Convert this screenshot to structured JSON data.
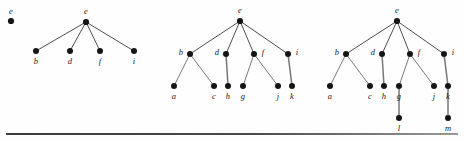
{
  "figure": {
    "caption_rule": "horizontal-rule",
    "panels": [
      {
        "id": "panel-0",
        "name": "single-node-graph",
        "nodes": [
          {
            "id": "n0-e",
            "label": "e",
            "x": 11,
            "y": 21,
            "label_x": 11,
            "label_y": 11,
            "r": 3.1
          }
        ],
        "edges": []
      },
      {
        "id": "panel-1",
        "name": "depth-two-tree",
        "nodes": [
          {
            "id": "n1-e",
            "label": "e",
            "x": 86,
            "y": 22,
            "label_x": 86,
            "label_y": 11,
            "r": 3.1
          },
          {
            "id": "n1-b",
            "label": "b",
            "x": 36,
            "y": 51,
            "label_x": 36,
            "label_y": 61,
            "r": 3.0
          },
          {
            "id": "n1-d",
            "label": "d",
            "x": 70,
            "y": 51,
            "label_x": 70,
            "label_y": 61,
            "r": 3.0
          },
          {
            "id": "n1-f",
            "label": "f",
            "x": 100,
            "y": 51,
            "label_x": 100,
            "label_y": 61,
            "r": 3.0
          },
          {
            "id": "n1-i",
            "label": "i",
            "x": 134,
            "y": 51,
            "label_x": 134,
            "label_y": 61,
            "r": 3.0
          }
        ],
        "edges": [
          {
            "from": "n1-e",
            "to": "n1-b",
            "kind": "root"
          },
          {
            "from": "n1-e",
            "to": "n1-d",
            "kind": "root"
          },
          {
            "from": "n1-e",
            "to": "n1-f",
            "kind": "root"
          },
          {
            "from": "n1-e",
            "to": "n1-i",
            "kind": "root"
          }
        ]
      },
      {
        "id": "panel-2",
        "name": "depth-three-tree",
        "nodes": [
          {
            "id": "n2-e",
            "label": "e",
            "x": 240,
            "y": 21,
            "label_x": 240,
            "label_y": 10,
            "r": 3.1
          },
          {
            "id": "n2-b",
            "label": "b",
            "x": 190,
            "y": 54,
            "label_x": 181,
            "label_y": 52,
            "r": 3.0
          },
          {
            "id": "n2-d",
            "label": "d",
            "x": 226,
            "y": 54,
            "label_x": 217,
            "label_y": 52,
            "r": 3.0
          },
          {
            "id": "n2-f",
            "label": "f",
            "x": 254,
            "y": 54,
            "label_x": 263,
            "label_y": 52,
            "r": 3.0
          },
          {
            "id": "n2-i",
            "label": "i",
            "x": 288,
            "y": 54,
            "label_x": 297,
            "label_y": 52,
            "r": 3.0
          },
          {
            "id": "n2-a",
            "label": "a",
            "x": 174,
            "y": 86,
            "label_x": 174,
            "label_y": 96,
            "r": 3.0
          },
          {
            "id": "n2-c",
            "label": "c",
            "x": 214,
            "y": 86,
            "label_x": 214,
            "label_y": 96,
            "r": 3.0
          },
          {
            "id": "n2-h",
            "label": "h",
            "x": 228,
            "y": 86,
            "label_x": 228,
            "label_y": 96,
            "r": 3.0
          },
          {
            "id": "n2-g",
            "label": "g",
            "x": 243,
            "y": 86,
            "label_x": 243,
            "label_y": 96,
            "r": 3.0
          },
          {
            "id": "n2-j",
            "label": "j",
            "x": 278,
            "y": 86,
            "label_x": 278,
            "label_y": 96,
            "r": 3.0
          },
          {
            "id": "n2-k",
            "label": "k",
            "x": 292,
            "y": 86,
            "label_x": 292,
            "label_y": 96,
            "r": 3.0
          }
        ],
        "edges": [
          {
            "from": "n2-e",
            "to": "n2-b",
            "kind": "root"
          },
          {
            "from": "n2-e",
            "to": "n2-d",
            "kind": "root"
          },
          {
            "from": "n2-e",
            "to": "n2-f",
            "kind": "root"
          },
          {
            "from": "n2-e",
            "to": "n2-i",
            "kind": "root"
          },
          {
            "from": "n2-b",
            "to": "n2-a",
            "kind": "diag"
          },
          {
            "from": "n2-b",
            "to": "n2-c",
            "kind": "diag"
          },
          {
            "from": "n2-d",
            "to": "n2-h",
            "kind": "vert"
          },
          {
            "from": "n2-f",
            "to": "n2-g",
            "kind": "diag"
          },
          {
            "from": "n2-f",
            "to": "n2-j",
            "kind": "diag"
          },
          {
            "from": "n2-i",
            "to": "n2-k",
            "kind": "vert"
          }
        ]
      },
      {
        "id": "panel-3",
        "name": "depth-four-tree",
        "nodes": [
          {
            "id": "n3-e",
            "label": "e",
            "x": 397,
            "y": 21,
            "label_x": 397,
            "label_y": 10,
            "r": 3.1
          },
          {
            "id": "n3-b",
            "label": "b",
            "x": 346,
            "y": 54,
            "label_x": 337,
            "label_y": 52,
            "r": 3.0
          },
          {
            "id": "n3-d",
            "label": "d",
            "x": 382,
            "y": 54,
            "label_x": 373,
            "label_y": 52,
            "r": 3.0
          },
          {
            "id": "n3-f",
            "label": "f",
            "x": 410,
            "y": 54,
            "label_x": 419,
            "label_y": 52,
            "r": 3.0
          },
          {
            "id": "n3-i",
            "label": "i",
            "x": 444,
            "y": 54,
            "label_x": 453,
            "label_y": 52,
            "r": 3.0
          },
          {
            "id": "n3-a",
            "label": "a",
            "x": 330,
            "y": 86,
            "label_x": 330,
            "label_y": 96,
            "r": 3.0
          },
          {
            "id": "n3-c",
            "label": "c",
            "x": 370,
            "y": 86,
            "label_x": 370,
            "label_y": 96,
            "r": 3.0
          },
          {
            "id": "n3-h",
            "label": "h",
            "x": 384,
            "y": 86,
            "label_x": 384,
            "label_y": 96,
            "r": 3.0
          },
          {
            "id": "n3-g",
            "label": "g",
            "x": 399,
            "y": 86,
            "label_x": 399,
            "label_y": 96,
            "r": 3.0
          },
          {
            "id": "n3-j",
            "label": "j",
            "x": 434,
            "y": 86,
            "label_x": 434,
            "label_y": 96,
            "r": 3.0
          },
          {
            "id": "n3-k",
            "label": "k",
            "x": 448,
            "y": 86,
            "label_x": 448,
            "label_y": 96,
            "r": 3.0
          },
          {
            "id": "n3-l",
            "label": "l",
            "x": 399,
            "y": 118,
            "label_x": 399,
            "label_y": 128,
            "r": 3.0
          },
          {
            "id": "n3-m",
            "label": "m",
            "x": 448,
            "y": 118,
            "label_x": 448,
            "label_y": 128,
            "r": 3.0
          }
        ],
        "edges": [
          {
            "from": "n3-e",
            "to": "n3-b",
            "kind": "root"
          },
          {
            "from": "n3-e",
            "to": "n3-d",
            "kind": "root"
          },
          {
            "from": "n3-e",
            "to": "n3-f",
            "kind": "root"
          },
          {
            "from": "n3-e",
            "to": "n3-i",
            "kind": "root"
          },
          {
            "from": "n3-b",
            "to": "n3-a",
            "kind": "diag"
          },
          {
            "from": "n3-b",
            "to": "n3-c",
            "kind": "diag"
          },
          {
            "from": "n3-d",
            "to": "n3-h",
            "kind": "vert"
          },
          {
            "from": "n3-f",
            "to": "n3-g",
            "kind": "diag"
          },
          {
            "from": "n3-f",
            "to": "n3-j",
            "kind": "diag"
          },
          {
            "from": "n3-i",
            "to": "n3-k",
            "kind": "vert"
          },
          {
            "from": "n3-g",
            "to": "n3-l",
            "kind": "vert"
          },
          {
            "from": "n3-k",
            "to": "n3-m",
            "kind": "vert"
          }
        ]
      }
    ]
  }
}
